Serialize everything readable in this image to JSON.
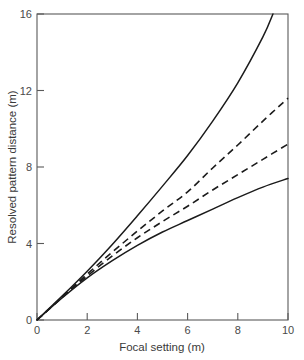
{
  "chart_data": {
    "type": "line",
    "title": "",
    "subtitle": "",
    "xlabel": "Focal setting (m)",
    "ylabel": "Resolved pattern distance (m)",
    "xlim": [
      0,
      10
    ],
    "ylim": [
      0,
      16
    ],
    "xticks": [
      0,
      2,
      4,
      6,
      8,
      10
    ],
    "xticklabels": [
      "0",
      "2",
      "4",
      "6",
      "8",
      "10"
    ],
    "yticks": [
      0,
      4,
      8,
      12,
      16
    ],
    "yticklabels": [
      "0",
      "4",
      "8",
      "12",
      "16"
    ],
    "grid": false,
    "legend": "none",
    "annotations": [],
    "axes_spines": [
      "left",
      "bottom",
      "top",
      "right"
    ],
    "x": [
      0,
      1,
      2,
      3,
      4,
      5,
      6,
      7,
      8,
      9,
      9.4,
      10
    ],
    "series": [
      {
        "name": "upper-solid",
        "style": "solid",
        "color": "#1b1b1b",
        "clipped_at_top": true,
        "exit_x": 9.4,
        "exit_y": 16,
        "values": [
          0,
          1.25,
          2.55,
          3.95,
          5.45,
          7.0,
          8.6,
          10.4,
          12.4,
          14.8,
          16.0,
          null
        ]
      },
      {
        "name": "upper-dashed",
        "style": "dashed",
        "color": "#1b1b1b",
        "clipped_at_top": false,
        "exit_x": 10,
        "exit_y": 11.6,
        "values": [
          0,
          1.2,
          2.4,
          3.55,
          4.65,
          5.7,
          6.7,
          7.95,
          9.15,
          10.4,
          null,
          11.6
        ]
      },
      {
        "name": "lower-dashed",
        "style": "dashed",
        "color": "#1b1b1b",
        "clipped_at_top": false,
        "exit_x": 10,
        "exit_y": 9.2,
        "values": [
          0,
          1.18,
          2.3,
          3.35,
          4.3,
          5.15,
          5.95,
          6.8,
          7.6,
          8.4,
          null,
          9.2
        ]
      },
      {
        "name": "lower-solid",
        "style": "solid",
        "color": "#1b1b1b",
        "clipped_at_top": false,
        "exit_x": 10,
        "exit_y": 7.4,
        "values": [
          0,
          1.15,
          2.2,
          3.1,
          3.9,
          4.6,
          5.2,
          5.8,
          6.4,
          6.95,
          null,
          7.4
        ]
      }
    ]
  }
}
